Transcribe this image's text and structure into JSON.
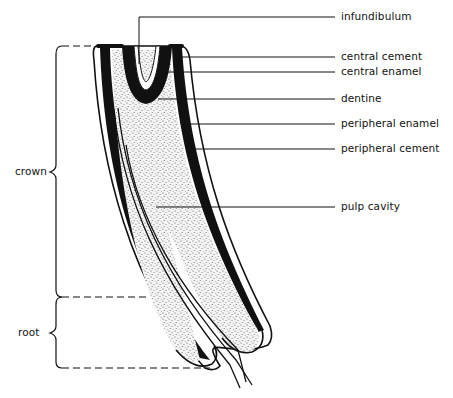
{
  "diagram": {
    "labels": [
      {
        "id": "infundibulum",
        "text": "infundibulum",
        "x": 341,
        "y": 17
      },
      {
        "id": "central-cement",
        "text": "central cement",
        "x": 341,
        "y": 53
      },
      {
        "id": "central-enamel",
        "text": "central enamel",
        "x": 341,
        "y": 67
      },
      {
        "id": "dentine",
        "text": "dentine",
        "x": 341,
        "y": 93
      },
      {
        "id": "peripheral-enamel",
        "text": "peripheral enamel",
        "x": 341,
        "y": 118
      },
      {
        "id": "peripheral-cement",
        "text": "peripheral cement",
        "x": 341,
        "y": 143
      },
      {
        "id": "pulp-cavity",
        "text": "pulp cavity",
        "x": 341,
        "y": 201
      }
    ],
    "regions": [
      {
        "id": "crown",
        "text": "crown",
        "x": 15,
        "y": 165
      },
      {
        "id": "root",
        "text": "root",
        "x": 18,
        "y": 325
      }
    ],
    "colors": {
      "ink": "#111111",
      "background": "#ffffff",
      "stipple": "#555555"
    }
  }
}
